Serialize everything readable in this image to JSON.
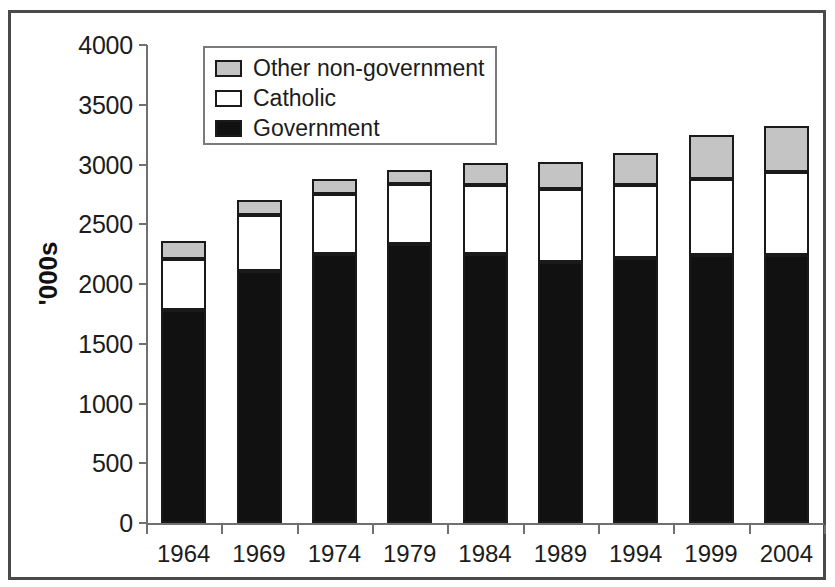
{
  "chart_data": {
    "type": "bar",
    "subtype": "stacked-bar",
    "title": "",
    "xlabel": "",
    "ylabel": "'000s",
    "ylim": [
      0,
      4000
    ],
    "ytick_step": 500,
    "yticks": [
      "0",
      "500",
      "1000",
      "1500",
      "2000",
      "2500",
      "3000",
      "3500",
      "4000"
    ],
    "grid": false,
    "legend_position": "top-left-inside",
    "categories": [
      "1964",
      "1969",
      "1974",
      "1979",
      "1984",
      "1989",
      "1994",
      "1999",
      "2004"
    ],
    "series": [
      {
        "name": "Government",
        "color": "#111111",
        "values": [
          1780,
          2110,
          2250,
          2335,
          2255,
          2185,
          2215,
          2245,
          2245
        ]
      },
      {
        "name": "Catholic",
        "color": "#ffffff",
        "values": [
          430,
          470,
          505,
          500,
          575,
          610,
          610,
          635,
          690
        ]
      },
      {
        "name": "Other non-government",
        "color": "#c4c4c4",
        "values": [
          150,
          125,
          125,
          120,
          180,
          225,
          270,
          370,
          390
        ]
      }
    ],
    "stack_order_bottom_to_top": [
      "Government",
      "Catholic",
      "Other non-government"
    ],
    "totals": [
      2360,
      2705,
      2880,
      2955,
      3010,
      3020,
      3095,
      3250,
      3325
    ]
  },
  "legend": {
    "items": [
      {
        "label": "Other non-government",
        "swatch": "grey-swatch"
      },
      {
        "label": "Catholic",
        "swatch": "white-swatch"
      },
      {
        "label": "Government",
        "swatch": "black-swatch"
      }
    ]
  },
  "colors": {
    "government": "#111111",
    "catholic": "#ffffff",
    "other_non_government": "#c4c4c4",
    "axis": "#707070",
    "text": "#1c1c1c",
    "frame": "#4a4a4a"
  }
}
